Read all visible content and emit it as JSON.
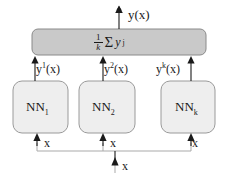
{
  "diagram": {
    "colors": {
      "average_box_fill": "#c9c9c9",
      "average_box_stroke": "#8a8a8a",
      "nn_box_fill": "#eeeeee",
      "nn_box_stroke": "#9a9a9a",
      "arrow": "#1a1a1a",
      "bus_line": "#a9a9a9",
      "background": "#ffffff"
    },
    "output": {
      "label": "y(x)"
    },
    "average_box": {
      "formula_fraction_numerator": "1",
      "formula_fraction_denominator": "k",
      "formula_sum_symbol": "Σ",
      "formula_term": "y",
      "formula_term_superscript": "j",
      "formula_text": "1/k Σ y^j"
    },
    "networks": [
      {
        "name": "NN",
        "subscript": "1",
        "output_label_base": "y",
        "output_label_superscript": "1",
        "output_label_suffix": "(x)",
        "input_label": "x"
      },
      {
        "name": "NN",
        "subscript": "2",
        "output_label_base": "y",
        "output_label_superscript": "2",
        "output_label_suffix": "(x)",
        "input_label": "x"
      },
      {
        "name": "NN",
        "subscript": "k",
        "output_label_base": "y",
        "output_label_superscript": "k",
        "output_label_suffix": "(x)",
        "input_label": "x"
      }
    ],
    "shared_input": {
      "label": "x"
    }
  }
}
